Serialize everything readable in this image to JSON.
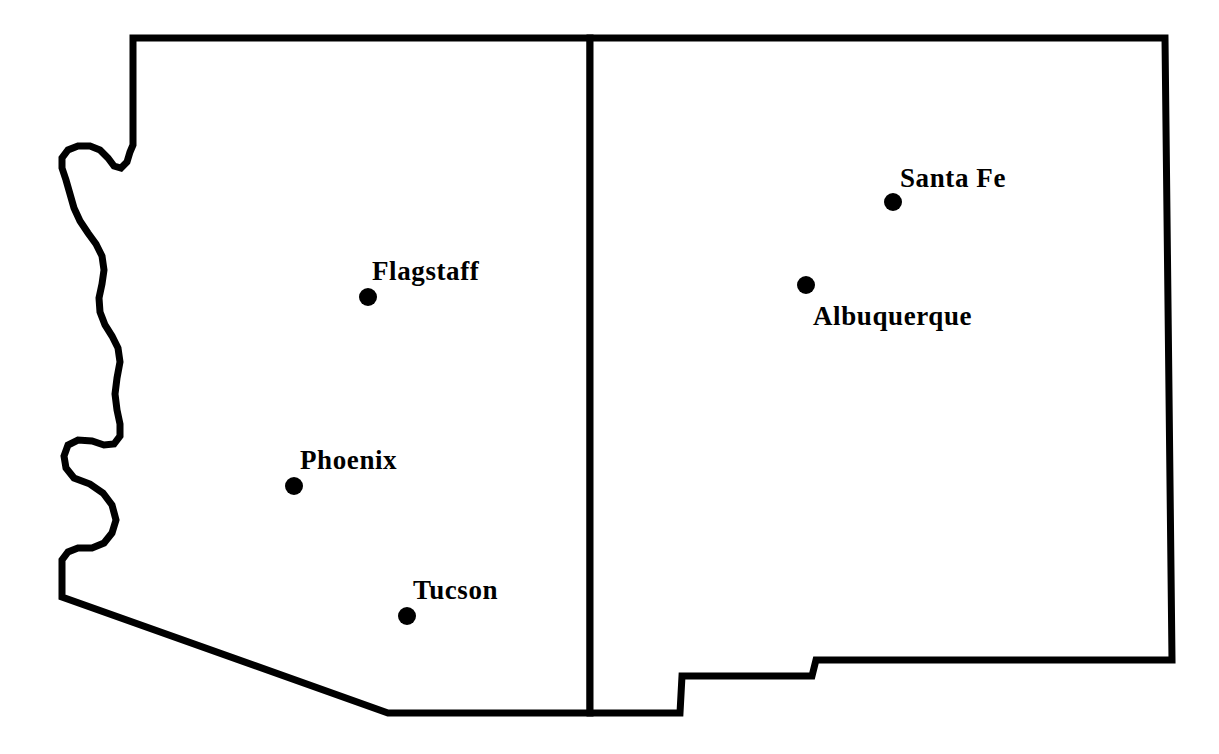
{
  "map": {
    "title": "Arizona and New Mexico",
    "background_color": "#ffffff",
    "outline_color": "#000000",
    "dot_color": "#000000",
    "label_color": "#000000",
    "states": [
      {
        "name": "Arizona",
        "abbr": "AZ",
        "position": "left"
      },
      {
        "name": "New Mexico",
        "abbr": "NM",
        "position": "right"
      }
    ],
    "divider": {
      "name": "arizona-new-mexico-border",
      "x": 590,
      "y_top": 38,
      "y_bottom": 713
    },
    "cities": [
      {
        "name": "Flagstaff",
        "state": "Arizona",
        "dot_x": 368,
        "dot_y": 297,
        "label_x": 372,
        "label_y": 258,
        "label_anchor": "left"
      },
      {
        "name": "Phoenix",
        "state": "Arizona",
        "dot_x": 294,
        "dot_y": 486,
        "label_x": 300,
        "label_y": 447,
        "label_anchor": "left"
      },
      {
        "name": "Tucson",
        "state": "Arizona",
        "dot_x": 407,
        "dot_y": 616,
        "label_x": 413,
        "label_y": 577,
        "label_anchor": "left"
      },
      {
        "name": "Santa Fe",
        "state": "New Mexico",
        "dot_x": 893,
        "dot_y": 202,
        "label_x": 900,
        "label_y": 165,
        "label_anchor": "left"
      },
      {
        "name": "Albuquerque",
        "state": "New Mexico",
        "dot_x": 806,
        "dot_y": 285,
        "label_x": 813,
        "label_y": 303,
        "label_anchor": "left"
      }
    ],
    "dot_radius": 9
  },
  "chart_data": {
    "type": "map",
    "regions": [
      "Arizona",
      "New Mexico"
    ],
    "point_labels": [
      "Flagstaff",
      "Phoenix",
      "Tucson",
      "Santa Fe",
      "Albuquerque"
    ],
    "points": [
      {
        "label": "Flagstaff",
        "region": "Arizona",
        "x": 368,
        "y": 297
      },
      {
        "label": "Phoenix",
        "region": "Arizona",
        "x": 294,
        "y": 486
      },
      {
        "label": "Tucson",
        "region": "Arizona",
        "x": 407,
        "y": 616
      },
      {
        "label": "Santa Fe",
        "region": "New Mexico",
        "x": 893,
        "y": 202
      },
      {
        "label": "Albuquerque",
        "region": "New Mexico",
        "x": 806,
        "y": 285
      }
    ],
    "xlim": [
      0,
      1219
    ],
    "ylim": [
      0,
      754
    ],
    "grid": false,
    "legend": "none"
  }
}
